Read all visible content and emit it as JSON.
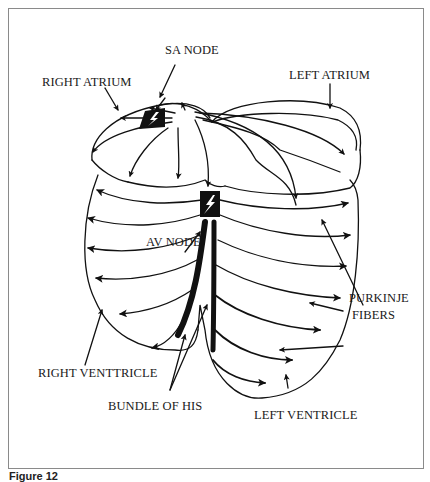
{
  "figure": {
    "caption": "Figure 12",
    "colors": {
      "ink": "#111111",
      "frame": "#8a8a8a",
      "background": "#ffffff"
    }
  },
  "labels": {
    "sa_node": "SA NODE",
    "right_atrium": "RIGHT ATRIUM",
    "left_atrium": "LEFT ATRIUM",
    "av_node": "AV NODE",
    "purkinje_fibers_line1": "PURKINJE",
    "purkinje_fibers_line2": "FIBERS",
    "right_ventricle": "RIGHT VENTTRICLE",
    "bundle_of_his": "BUNDLE OF HIS",
    "left_ventricle": "LEFT VENTRICLE"
  },
  "icons": {
    "sa_node_marker": "lightning-bolt-icon",
    "av_node_marker": "lightning-bolt-icon"
  }
}
